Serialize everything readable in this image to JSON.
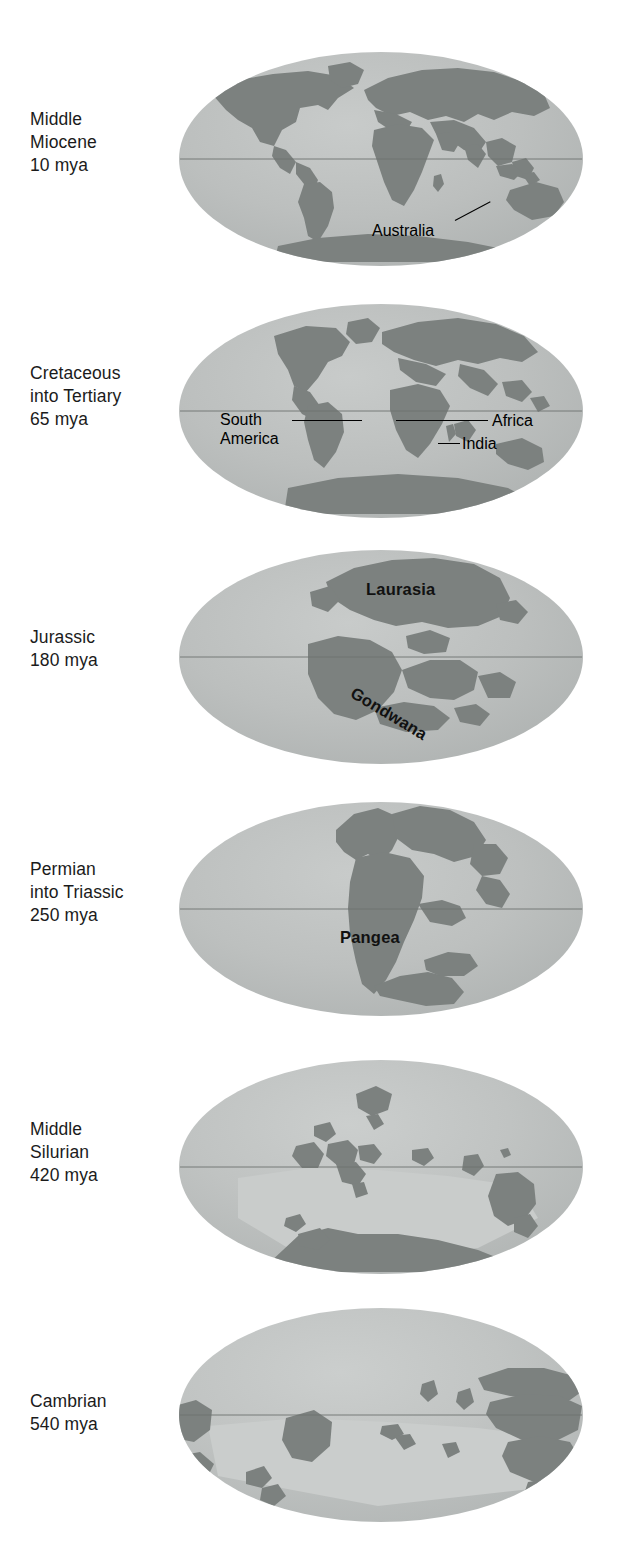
{
  "figure": {
    "projection": "mollweide-ellipse",
    "ocean_color": "#b9bcbb",
    "ocean_color_light": "#cdd0cf",
    "land_color": "#7d8280",
    "land_color_dark": "#6b706e",
    "equator_color": "#6e7370",
    "text_color": "#1b1b1b"
  },
  "panels": [
    {
      "id": "middle-miocene",
      "era_label": "Middle\nMiocene\n10 mya",
      "era_name": "Middle Miocene",
      "age": "10 mya",
      "annotations": [
        {
          "text": "Australia",
          "kind": "leader-label"
        }
      ]
    },
    {
      "id": "cretaceous-into-tertiary",
      "era_label": "Cretaceous\ninto Tertiary\n65 mya",
      "era_name": "Cretaceous into Tertiary",
      "age": "65 mya",
      "annotations": [
        {
          "text": "South\nAmerica",
          "kind": "leader-label"
        },
        {
          "text": "Africa",
          "kind": "leader-label"
        },
        {
          "text": "India",
          "kind": "leader-label"
        }
      ]
    },
    {
      "id": "jurassic",
      "era_label": "Jurassic\n180 mya",
      "era_name": "Jurassic",
      "age": "180 mya",
      "annotations": [
        {
          "text": "Laurasia",
          "kind": "landmass-label"
        },
        {
          "text": "Gondwana",
          "kind": "landmass-label-rotated"
        }
      ]
    },
    {
      "id": "permian-into-triassic",
      "era_label": "Permian\ninto Triassic\n250 mya",
      "era_name": "Permian into Triassic",
      "age": "250 mya",
      "annotations": [
        {
          "text": "Pangea",
          "kind": "landmass-label"
        }
      ]
    },
    {
      "id": "middle-silurian",
      "era_label": "Middle\nSilurian\n420 mya",
      "era_name": "Middle Silurian",
      "age": "420 mya",
      "annotations": []
    },
    {
      "id": "cambrian",
      "era_label": "Cambrian\n540 mya",
      "era_name": "Cambrian",
      "age": "540 mya",
      "annotations": []
    }
  ],
  "labels": {
    "australia": "Australia",
    "south_america": "South\nAmerica",
    "africa": "Africa",
    "india": "India",
    "laurasia": "Laurasia",
    "gondwana": "Gondwana",
    "pangea": "Pangea"
  }
}
